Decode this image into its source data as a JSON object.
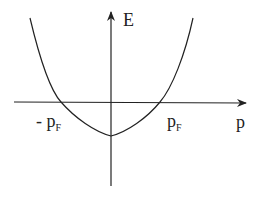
{
  "diagram": {
    "axes": {
      "y_label": "E",
      "x_label": "p"
    },
    "markers": {
      "neg_fermi": {
        "sign": "- ",
        "symbol": "p",
        "subscript": "F"
      },
      "pos_fermi": {
        "symbol": "p",
        "subscript": "F"
      }
    },
    "curve": "parabola crossing p-axis at -pF and pF, minimum below origin",
    "colors": {
      "line": "#222222",
      "background": "#ffffff"
    }
  }
}
